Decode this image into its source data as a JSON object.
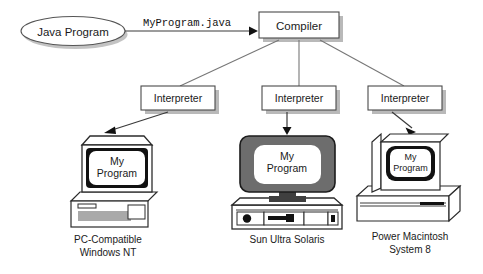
{
  "diagram": {
    "title_source": "Java Program",
    "source_node": {
      "label": "Java Program",
      "shape": "ellipse"
    },
    "edge_label": "MyProgram.java",
    "compiler": {
      "label": "Compiler"
    },
    "interpreters": [
      {
        "label": "Interpreter"
      },
      {
        "label": "Interpreter"
      },
      {
        "label": "Interpreter"
      }
    ],
    "screen_text": {
      "line1": "My",
      "line2": "Program"
    },
    "platforms": [
      {
        "caption_line1": "PC-Compatible",
        "caption_line2": "Windows NT",
        "screen_line1": "My",
        "screen_line2": "Program"
      },
      {
        "caption_line1": "Sun Ultra Solaris",
        "caption_line2": "",
        "screen_line1": "My",
        "screen_line2": "Program"
      },
      {
        "caption_line1": "Power Macintosh",
        "caption_line2": "System 8",
        "screen_line1": "My",
        "screen_line2": "Program"
      }
    ],
    "colors": {
      "ink": "#2b2b2b",
      "box_stroke": "#4a4a4a",
      "shadow": "#b9b9b9",
      "connector": "#777777",
      "screen_white": "#ffffff",
      "monitor_dark": "#6d6d6d",
      "background": "#ffffff"
    }
  }
}
